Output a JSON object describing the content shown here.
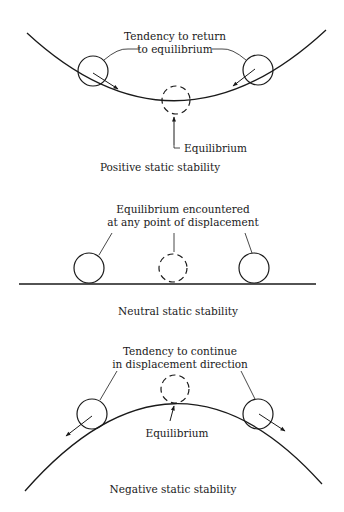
{
  "panels": {
    "positive": {
      "annotation_line1": "Tendency to return",
      "annotation_line2": "to equilibrium",
      "equilibrium_label": "Equilibrium",
      "caption": "Positive static stability"
    },
    "neutral": {
      "annotation_line1": "Equilibrium encountered",
      "annotation_line2": "at any point of displacement",
      "caption": "Neutral static stability"
    },
    "negative": {
      "annotation_line1": "Tendency to continue",
      "annotation_line2": "in displacement direction",
      "equilibrium_label": "Equilibrium",
      "caption": "Negative static stability"
    }
  }
}
